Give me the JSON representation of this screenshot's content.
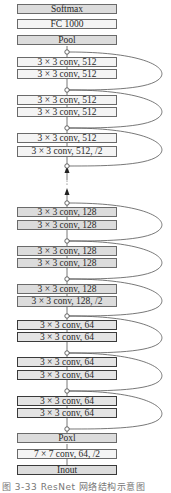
{
  "diagram": {
    "layers_top_to_bottom": [
      {
        "id": "softmax",
        "label": "Softmax"
      },
      {
        "id": "fc",
        "label": "FC 1000"
      },
      {
        "id": "pool_top",
        "label": "Pool"
      },
      {
        "id": "c512_1a",
        "label": "3 × 3 conv, 512"
      },
      {
        "id": "c512_1b",
        "label": "3 × 3 conv, 512"
      },
      {
        "id": "c512_2a",
        "label": "3 × 3 conv, 512"
      },
      {
        "id": "c512_2b",
        "label": "3 × 3 conv, 512"
      },
      {
        "id": "c512_3a",
        "label": "3 × 3 conv, 512"
      },
      {
        "id": "c512_3b",
        "label": "3 × 3 conv, 512, /2"
      },
      {
        "id": "c128_1a",
        "label": "3 × 3 conv, 128"
      },
      {
        "id": "c128_1b",
        "label": "3 × 3 conv, 128"
      },
      {
        "id": "c128_2a",
        "label": "3 × 3 conv, 128"
      },
      {
        "id": "c128_2b",
        "label": "3 × 3 conv, 128"
      },
      {
        "id": "c128_3a",
        "label": "3 × 3 conv, 128"
      },
      {
        "id": "c128_3b",
        "label": "3 × 3 conv, 128, /2"
      },
      {
        "id": "c64_1a",
        "label": "3 × 3 conv, 64"
      },
      {
        "id": "c64_1b",
        "label": "3 × 3 conv, 64"
      },
      {
        "id": "c64_2a",
        "label": "3 × 3 conv, 64"
      },
      {
        "id": "c64_2b",
        "label": "3 × 3 conv, 64"
      },
      {
        "id": "c64_3a",
        "label": "3 × 3 conv, 64"
      },
      {
        "id": "c64_3b",
        "label": "3 × 3 conv, 64"
      },
      {
        "id": "pool_bottom",
        "label": "Poxl"
      },
      {
        "id": "conv7",
        "label": "7 × 7 conv, 64, /2"
      },
      {
        "id": "input",
        "label": "Inout"
      }
    ],
    "ellipsis": "⋮",
    "skip_connections": 9
  },
  "caption": "图 3-33  ResNet 网络结构示意图"
}
